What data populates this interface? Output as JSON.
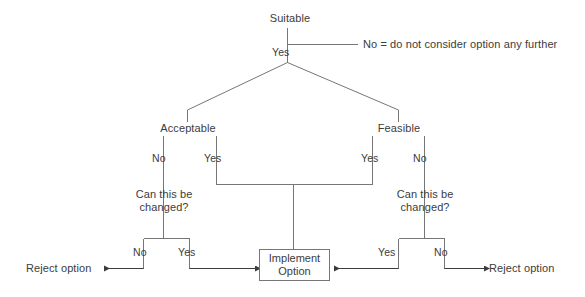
{
  "diagram": {
    "line_color": "#767676",
    "text_color": "#3c3c3c",
    "background": "#ffffff"
  },
  "nodes": {
    "root": {
      "label": "Suitable"
    },
    "left_branch": {
      "label": "Acceptable"
    },
    "right_branch": {
      "label": "Feasible"
    },
    "left_change": {
      "label": "Can this be changed?"
    },
    "right_change": {
      "label": "Can this be changed?"
    },
    "implement": {
      "line1": "Implement",
      "line2": "Option"
    }
  },
  "edges": {
    "root_yes": "Yes",
    "acceptable_no": "No",
    "acceptable_yes": "Yes",
    "feasible_yes": "Yes",
    "feasible_no": "No",
    "left_change_no": "No",
    "left_change_yes": "Yes",
    "right_change_yes": "Yes",
    "right_change_no": "No"
  },
  "terminals": {
    "left_reject": "Reject option",
    "right_reject": "Reject option"
  },
  "notes": {
    "root_no": "No = do not consider option any further"
  }
}
